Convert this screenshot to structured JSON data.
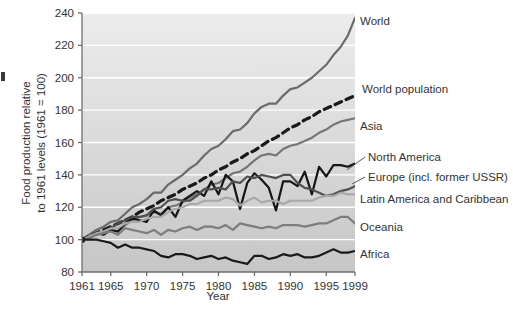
{
  "chart_data": {
    "type": "line",
    "title": "",
    "xlabel": "Year",
    "ylabel": "Food production relative to 1961 levels (1961 = 100)",
    "ylabel_line1": "Food production relative",
    "ylabel_line2": "to 1961 levels (1961 = 100)",
    "xlim": [
      1961,
      1999
    ],
    "ylim": [
      80,
      240
    ],
    "yticks": [
      80,
      100,
      120,
      140,
      160,
      180,
      200,
      220,
      240
    ],
    "xticks": [
      1961,
      1965,
      1970,
      1975,
      1980,
      1985,
      1990,
      1995,
      1999
    ],
    "grid": "horizontal-white",
    "legend_position": "right-inline-labels",
    "x": [
      1961,
      1962,
      1963,
      1964,
      1965,
      1966,
      1967,
      1968,
      1969,
      1970,
      1971,
      1972,
      1973,
      1974,
      1975,
      1976,
      1977,
      1978,
      1979,
      1980,
      1981,
      1982,
      1983,
      1984,
      1985,
      1986,
      1987,
      1988,
      1989,
      1990,
      1991,
      1992,
      1993,
      1994,
      1995,
      1996,
      1997,
      1998,
      1999
    ],
    "series": [
      {
        "name": "World",
        "color": "#6a6a6a",
        "width": 2.2,
        "dash": "none",
        "label": "World",
        "label_value": 240,
        "values": [
          100,
          103,
          106,
          108,
          111,
          112,
          116,
          120,
          122,
          125,
          129,
          129,
          134,
          137,
          140,
          144,
          147,
          152,
          156,
          158,
          162,
          167,
          168,
          172,
          178,
          182,
          184,
          184,
          189,
          193,
          194,
          197,
          200,
          204,
          208,
          214,
          219,
          226,
          237
        ]
      },
      {
        "name": "World population",
        "color": "#1a1a1a",
        "width": 3.2,
        "dash": "7,5",
        "label": "World population",
        "label_value": 183,
        "values": [
          100,
          102,
          104,
          106,
          108,
          110,
          112,
          114,
          117,
          119,
          121,
          124,
          126,
          128,
          131,
          133,
          135,
          138,
          140,
          143,
          145,
          148,
          150,
          153,
          155,
          158,
          161,
          163,
          166,
          169,
          171,
          174,
          176,
          179,
          181,
          183,
          185,
          187,
          189
        ]
      },
      {
        "name": "Asia",
        "color": "#757575",
        "width": 2.2,
        "dash": "none",
        "label": "Asia",
        "label_value": 160,
        "values": [
          100,
          101,
          103,
          104,
          106,
          105,
          109,
          112,
          114,
          115,
          117,
          116,
          120,
          121,
          123,
          126,
          128,
          131,
          134,
          135,
          138,
          141,
          142,
          145,
          149,
          152,
          153,
          152,
          156,
          158,
          159,
          161,
          163,
          166,
          168,
          171,
          173,
          174,
          175
        ]
      },
      {
        "name": "North America",
        "color": "#151515",
        "width": 2.2,
        "dash": "none",
        "label": "North America",
        "label_value": 142,
        "values": [
          100,
          101,
          104,
          103,
          106,
          105,
          110,
          113,
          112,
          111,
          118,
          115,
          120,
          114,
          124,
          127,
          130,
          127,
          136,
          128,
          140,
          136,
          119,
          135,
          141,
          137,
          132,
          118,
          136,
          136,
          133,
          142,
          128,
          145,
          139,
          146,
          146,
          145,
          147
        ]
      },
      {
        "name": "Europe (incl. former USSR)",
        "color": "#4f4f4f",
        "width": 2.2,
        "dash": "none",
        "label": "Europe (incl. former USSR)",
        "label_value": 133,
        "values": [
          100,
          102,
          103,
          105,
          107,
          110,
          112,
          114,
          114,
          115,
          119,
          120,
          124,
          125,
          124,
          124,
          127,
          131,
          131,
          132,
          131,
          136,
          135,
          139,
          138,
          140,
          139,
          138,
          140,
          140,
          135,
          132,
          131,
          129,
          127,
          128,
          130,
          131,
          133
        ]
      },
      {
        "name": "Latin America and Caribbean",
        "color": "#a8a8a8",
        "width": 2.2,
        "dash": "none",
        "label": "Latin America and Caribbean",
        "label_value": 124,
        "values": [
          100,
          102,
          104,
          105,
          107,
          107,
          110,
          111,
          111,
          113,
          114,
          114,
          117,
          119,
          120,
          122,
          122,
          124,
          124,
          124,
          126,
          125,
          121,
          124,
          126,
          123,
          124,
          124,
          122,
          124,
          124,
          124,
          124,
          126,
          127,
          127,
          129,
          128,
          128
        ]
      },
      {
        "name": "Oceania",
        "color": "#7d7d7d",
        "width": 2.2,
        "dash": "none",
        "label": "Oceania",
        "label_value": 108,
        "values": [
          100,
          101,
          103,
          104,
          105,
          103,
          107,
          106,
          105,
          104,
          106,
          103,
          106,
          105,
          107,
          108,
          106,
          108,
          108,
          107,
          109,
          106,
          110,
          109,
          108,
          107,
          108,
          107,
          109,
          109,
          109,
          108,
          109,
          110,
          110,
          112,
          114,
          114,
          110
        ]
      },
      {
        "name": "Africa",
        "color": "#1a1a1a",
        "width": 2.2,
        "dash": "none",
        "label": "Africa",
        "label_value": 92,
        "values": [
          100,
          100,
          100,
          99,
          98,
          95,
          97,
          95,
          95,
          94,
          93,
          90,
          89,
          91,
          91,
          90,
          88,
          89,
          90,
          88,
          89,
          87,
          86,
          85,
          90,
          90,
          88,
          89,
          91,
          90,
          91,
          89,
          89,
          90,
          92,
          94,
          92,
          92,
          93
        ]
      }
    ],
    "leader_lines": [
      "North America",
      "Europe (incl. former USSR)"
    ]
  },
  "colors": {
    "plot_bg_top": "#e9e9e9",
    "plot_bg_bottom": "#c9c9c9",
    "gridline": "#ffffff",
    "axis": "#6d6d6d",
    "text": "#333333",
    "page_bg": "#ffffff"
  }
}
